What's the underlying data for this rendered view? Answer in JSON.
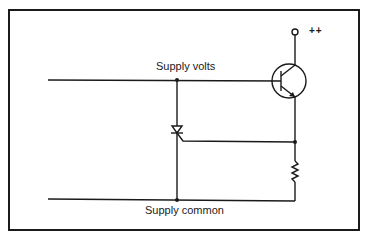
{
  "diagram": {
    "type": "circuit-schematic",
    "labels": {
      "supply_volts": "Supply volts",
      "supply_common": "Supply common",
      "positive_terminal": "++"
    },
    "components": [
      {
        "id": "Q1",
        "kind": "NPN transistor",
        "connections": {
          "base": "supply-volts-rail",
          "collector": "++ terminal",
          "emitter": "node-A"
        }
      },
      {
        "id": "SCR1",
        "kind": "thyristor",
        "connections": {
          "anode": "supply-volts-rail",
          "cathode": "supply-common-rail",
          "gate": "node-A"
        }
      },
      {
        "id": "R1",
        "kind": "resistor",
        "connections": {
          "a": "node-A",
          "b": "supply-common-rail"
        }
      }
    ],
    "colors": {
      "ink": "#1a1a1a",
      "background": "#ffffff"
    }
  }
}
